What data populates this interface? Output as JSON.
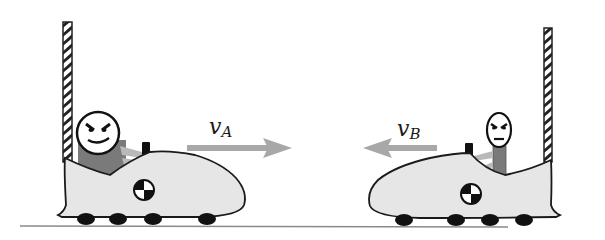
{
  "diagram": {
    "title": "",
    "colors": {
      "background": "#ffffff",
      "car_body": "#e6e6e6",
      "outline": "#1a1a1a",
      "torso": "#7a7a7a",
      "arm": "#b5b5b5",
      "arrow": "#a8a8a8",
      "ground": "#8a8a8a",
      "wheel": "#111111",
      "pole_stripe": "#222222"
    },
    "cars": [
      {
        "id": "A",
        "direction": "right",
        "velocity_label": {
          "symbol": "v",
          "subscript": "A"
        },
        "driver_size": "large"
      },
      {
        "id": "B",
        "direction": "left",
        "velocity_label": {
          "symbol": "v",
          "subscript": "B"
        },
        "driver_size": "small"
      }
    ],
    "icons": {
      "center_of_mass": "center-of-mass-icon",
      "velocity_arrow": "arrow-icon"
    }
  }
}
